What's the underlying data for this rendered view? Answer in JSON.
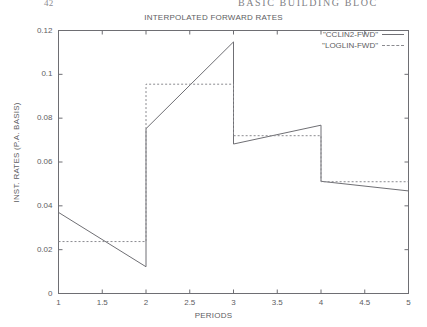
{
  "page_header": {
    "folio": "42",
    "running_head": "BASIC BUILDING BLOC"
  },
  "chart_data": {
    "type": "line",
    "title": "INTERPOLATED FORWARD RATES",
    "xlabel": "PERIODS",
    "ylabel": "INST. RATES (P.A. BASIS)",
    "xlim": [
      1,
      5
    ],
    "ylim": [
      0,
      0.12
    ],
    "grid": false,
    "legend_position": "top-right",
    "xticks": [
      1,
      1.5,
      2,
      2.5,
      3,
      3.5,
      4,
      4.5,
      5
    ],
    "xticklabels": [
      "1",
      "1.5",
      "2",
      "2.5",
      "3",
      "3.5",
      "4",
      "4.5",
      "5"
    ],
    "yticks": [
      0,
      0.02,
      0.04,
      0.06,
      0.08,
      0.1,
      0.12
    ],
    "yticklabels": [
      "0",
      "0.02",
      "0.04",
      "0.06",
      "0.08",
      "0.1",
      "0.12"
    ],
    "series": [
      {
        "name": "\"CCLIN2-FWD\"",
        "style": "solid",
        "color": "#6f6f74",
        "points": [
          [
            1.0,
            0.037
          ],
          [
            2.0,
            0.0122
          ],
          [
            2.0,
            0.0752
          ],
          [
            3.0,
            0.1148
          ],
          [
            3.0,
            0.0682
          ],
          [
            4.0,
            0.0768
          ],
          [
            4.0,
            0.0512
          ],
          [
            5.0,
            0.0468
          ]
        ]
      },
      {
        "name": "\"LOGLIN-FWD\"",
        "style": "dashed",
        "color": "#8a8a8f",
        "points": [
          [
            1.0,
            0.0237
          ],
          [
            2.0,
            0.0237
          ],
          [
            2.0,
            0.0955
          ],
          [
            3.0,
            0.0955
          ],
          [
            3.0,
            0.072
          ],
          [
            4.0,
            0.072
          ],
          [
            4.0,
            0.051
          ],
          [
            5.0,
            0.051
          ]
        ]
      }
    ]
  }
}
